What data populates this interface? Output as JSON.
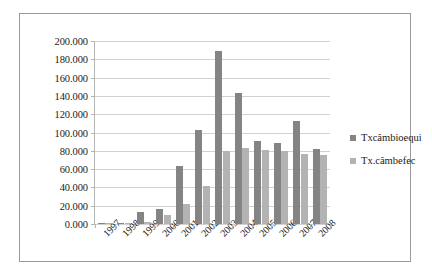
{
  "chart_data": {
    "type": "bar",
    "title": "",
    "xlabel": "",
    "ylabel": "",
    "categories": [
      "1997",
      "1998",
      "1999",
      "2000",
      "2001",
      "2002",
      "2003",
      "2004",
      "2005",
      "2006",
      "2007",
      "2008"
    ],
    "series": [
      {
        "name": "Txcâmbioequi",
        "color": "#848484",
        "values": [
          0.5,
          0.3,
          13.0,
          16.5,
          63.0,
          103.0,
          189.0,
          143.0,
          91.0,
          88.0,
          113.0,
          82.0
        ]
      },
      {
        "name": "Tx.câmbefec",
        "color": "#b3b3b3",
        "values": [
          0.2,
          0.2,
          2.0,
          10.0,
          22.0,
          42.0,
          80.0,
          83.0,
          81.0,
          80.0,
          77.0,
          75.0
        ]
      }
    ],
    "ylim": [
      0,
      200
    ],
    "ytick_step": 20,
    "ytick_labels": [
      "0.000",
      "20.000",
      "40.000",
      "60.000",
      "80.000",
      "100.000",
      "120.000",
      "140.000",
      "160.000",
      "180.000",
      "200.000"
    ],
    "grid": true,
    "legend_position": "right"
  },
  "legend": {
    "entries": [
      {
        "label": "Txcâmbioequi"
      },
      {
        "label": "Tx.câmbefec"
      }
    ]
  }
}
